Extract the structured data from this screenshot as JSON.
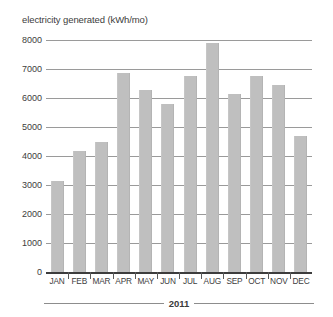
{
  "chart_data": {
    "type": "bar",
    "title": "electricity generated (kWh/mo)",
    "xlabel": "2011",
    "ylabel": "",
    "categories": [
      "JAN",
      "FEB",
      "MAR",
      "APR",
      "MAY",
      "JUN",
      "JUL",
      "AUG",
      "SEP",
      "OCT",
      "NOV",
      "DEC"
    ],
    "values": [
      3150,
      4180,
      4470,
      6850,
      6280,
      5780,
      6750,
      7900,
      6150,
      6750,
      6450,
      4680
    ],
    "series": [
      {
        "name": "electricity generated",
        "values": [
          3150,
          4180,
          4470,
          6850,
          6280,
          5780,
          6750,
          7900,
          6150,
          6750,
          6450,
          4680
        ]
      }
    ],
    "ylim": [
      0,
      8000
    ],
    "ytick_values": [
      8000,
      7000,
      6000,
      5000,
      4000,
      3000,
      2000,
      1000,
      0
    ],
    "ytick_labels": [
      "8000",
      "7000",
      "6000",
      "5000",
      "4000",
      "3000",
      "2000",
      "1000",
      "0"
    ],
    "grid": true,
    "legend": false,
    "legend_position": "none",
    "bar_color": "#bfbfbf",
    "gridline_color": "#9a9a9a",
    "axis_color": "#3d3d3d",
    "text_color": "#3d3d3d",
    "background": "#ffffff"
  },
  "axis": {
    "year_label": "2011"
  }
}
